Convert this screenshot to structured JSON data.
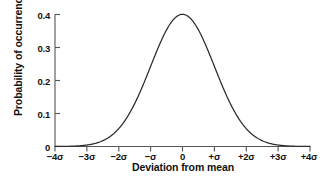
{
  "chart_data": {
    "type": "line",
    "title": "",
    "subtitle": "",
    "xlabel": "Deviation from mean",
    "ylabel": "Probability of occurrence",
    "xlim": [
      -4,
      4
    ],
    "ylim": [
      0,
      0.4
    ],
    "grid": false,
    "legend": "none",
    "curve_label": "standard normal probability density",
    "x_tick_labels": [
      "−4σ",
      "−3σ",
      "−2σ",
      "−σ",
      "0",
      "+σ",
      "+2σ",
      "+3σ",
      "+4σ"
    ],
    "x_tick_values": [
      -4,
      -3,
      -2,
      -1,
      0,
      1,
      2,
      3,
      4
    ],
    "y_tick_labels": [
      "0",
      "0.1",
      "0.2",
      "0.3",
      "0.4"
    ],
    "y_tick_values": [
      0,
      0.1,
      0.2,
      0.3,
      0.4
    ],
    "x": [
      -4,
      -3.8,
      -3.6,
      -3.4,
      -3.2,
      -3,
      -2.8,
      -2.6,
      -2.4,
      -2.2,
      -2,
      -1.8,
      -1.6,
      -1.4,
      -1.2,
      -1,
      -0.8,
      -0.6,
      -0.4,
      -0.2,
      0,
      0.2,
      0.4,
      0.6,
      0.8,
      1,
      1.2,
      1.4,
      1.6,
      1.8,
      2,
      2.2,
      2.4,
      2.6,
      2.8,
      3,
      3.2,
      3.4,
      3.6,
      3.8,
      4
    ],
    "values": [
      0.0001,
      0.0003,
      0.0006,
      0.0012,
      0.0024,
      0.0044,
      0.0079,
      0.0136,
      0.0224,
      0.0355,
      0.054,
      0.079,
      0.1109,
      0.1497,
      0.1942,
      0.242,
      0.2897,
      0.3332,
      0.3683,
      0.391,
      0.3989,
      0.391,
      0.3683,
      0.3332,
      0.2897,
      0.242,
      0.1942,
      0.1497,
      0.1109,
      0.079,
      0.054,
      0.0355,
      0.0224,
      0.0136,
      0.0079,
      0.0044,
      0.0024,
      0.0012,
      0.0006,
      0.0003,
      0.0001
    ],
    "peak_value": 0.4,
    "peak_x": 0,
    "colors": {
      "curve": "#2b2b2b",
      "axis": "#555555",
      "text": "#111111",
      "background": "#ffffff"
    }
  }
}
